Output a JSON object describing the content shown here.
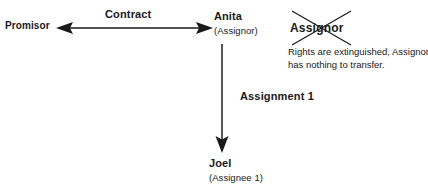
{
  "diagram": {
    "background_color": "#ffffff",
    "ink_color": "#1a1a1a",
    "nodes": [
      {
        "id": "promisor",
        "name": "Promisor",
        "role": ""
      },
      {
        "id": "anita",
        "name": "Anita",
        "role": "(Assignor)"
      },
      {
        "id": "joel",
        "name": "Joel",
        "role": "(Assignee 1)"
      }
    ],
    "edges": [
      {
        "id": "contract",
        "label": "Contract",
        "style": "double-headed-arrow",
        "orientation": "horizontal",
        "from": "promisor",
        "to": "anita"
      },
      {
        "id": "assignment-1",
        "label": "Assignment 1",
        "style": "single-headed-arrow",
        "orientation": "vertical",
        "from": "anita",
        "to": "joel"
      }
    ],
    "annotation": {
      "struck_label": "Assignor",
      "struck_through": true,
      "note_line_1": "Rights are extinguished, Assignor",
      "note_line_2": "has nothing to transfer."
    }
  }
}
